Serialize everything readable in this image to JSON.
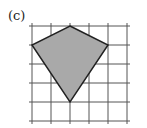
{
  "figure": {
    "label": "(c)",
    "grid": {
      "x_lines": [
        32,
        51,
        70,
        89,
        108,
        127
      ],
      "y_lines": [
        26,
        45,
        64,
        83,
        102,
        121
      ],
      "x_extent": [
        29,
        130
      ],
      "y_extent": [
        23,
        124
      ],
      "color": "#555555"
    },
    "shape": {
      "type": "kite",
      "vertices": [
        [
          70,
          26
        ],
        [
          108,
          45
        ],
        [
          70,
          102
        ],
        [
          32,
          45
        ]
      ],
      "vertices_grid_units": [
        [
          2,
          0
        ],
        [
          4,
          1
        ],
        [
          2,
          4
        ],
        [
          0,
          1
        ]
      ],
      "fill": "#a9a9a9",
      "stroke": "#222222"
    }
  }
}
